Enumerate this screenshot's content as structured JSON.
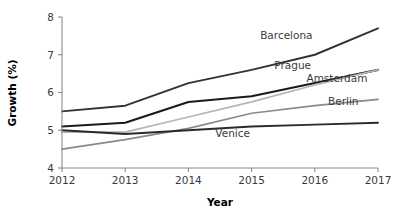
{
  "chart_data": {
    "type": "line",
    "title": "",
    "xlabel": "Year",
    "ylabel": "Growth (%)",
    "x": [
      2012,
      2013,
      2014,
      2015,
      2016,
      2017
    ],
    "xtick_labels": [
      "2012",
      "2013",
      "2014",
      "2015",
      "2016",
      "2017"
    ],
    "ytick_labels": [
      "4",
      "5",
      "6",
      "7",
      "8"
    ],
    "yticks": [
      4,
      5,
      6,
      7,
      8
    ],
    "xlim": [
      2012,
      2017
    ],
    "ylim": [
      4,
      8
    ],
    "grid": false,
    "legend_position": "inline-right-of-line-ends",
    "series": [
      {
        "name": "Barcelona",
        "values": [
          5.5,
          5.65,
          6.25,
          6.6,
          7.0,
          7.7
        ],
        "color": "#333333",
        "width": 1.9,
        "label_x": 2015.55,
        "label_y": 7.42,
        "label_anchor": "middle"
      },
      {
        "name": "Prague",
        "values": [
          5.1,
          5.2,
          5.75,
          5.9,
          6.25,
          6.6
        ],
        "color": "#1a1a1a",
        "width": 2.1,
        "label_x": 2015.65,
        "label_y": 6.62,
        "label_anchor": "middle"
      },
      {
        "name": "Amsterdam",
        "values": [
          4.95,
          4.95,
          5.35,
          5.75,
          6.2,
          6.6
        ],
        "color": "#b5b5b5",
        "width": 1.7,
        "label_x": 2016.35,
        "label_y": 6.28,
        "label_anchor": "middle"
      },
      {
        "name": "Berlin",
        "values": [
          4.5,
          4.75,
          5.05,
          5.45,
          5.65,
          5.82
        ],
        "color": "#8a8a8a",
        "width": 1.7,
        "label_x": 2016.45,
        "label_y": 5.68,
        "label_anchor": "middle"
      },
      {
        "name": "Venice",
        "values": [
          5.0,
          4.9,
          5.0,
          5.1,
          5.15,
          5.2
        ],
        "color": "#2b2b2b",
        "width": 1.9,
        "label_x": 2014.7,
        "label_y": 4.82,
        "label_anchor": "middle"
      }
    ]
  },
  "axes": {
    "y_axis_title": "Growth (%)",
    "x_axis_title": "Year"
  }
}
